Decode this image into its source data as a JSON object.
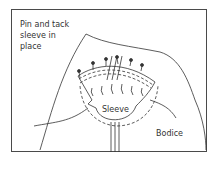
{
  "diagram": {
    "labels": {
      "instruction": "Pin and tack sleeve in place",
      "instruction_lines": [
        "Pin and tack",
        "sleeve in",
        "place"
      ],
      "sleeve": "Sleeve",
      "bodice": "Bodice"
    },
    "colors": {
      "line": "#333333",
      "frame": "#4a4a4a",
      "background": "#ffffff"
    }
  }
}
